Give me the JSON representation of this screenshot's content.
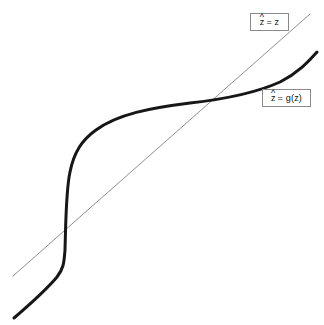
{
  "figure": {
    "background_color": "#ffffff",
    "width": 324,
    "height": 325
  },
  "labels": {
    "identity": {
      "var": "z",
      "hat": "^",
      "equation": "= z",
      "full_text": "ẑ = z"
    },
    "gfun": {
      "var": "z",
      "hat": "^",
      "equation": "= g(z)",
      "full_text": "ẑ = g(z)"
    }
  },
  "chart_data": {
    "type": "line",
    "title": "",
    "xlabel": "",
    "ylabel": "",
    "grid": false,
    "legend_position": "inline-boxed-annotations",
    "xlim": [
      0,
      324
    ],
    "ylim": [
      325,
      0
    ],
    "series": [
      {
        "name": "ẑ = z",
        "role": "identity-line",
        "color": "#8f8f8f",
        "linewidth": 1,
        "x": [
          13,
          310
        ],
        "y": [
          276,
          14
        ],
        "path": "M 13 276 L 310 14"
      },
      {
        "name": "ẑ = g(z)",
        "role": "sigmoid-response-curve",
        "color": "#161616",
        "linewidth": 3,
        "x": [
          14,
          30,
          46,
          58,
          64,
          67,
          70,
          76,
          92,
          120,
          150,
          190,
          228,
          262,
          290,
          305,
          313,
          317
        ],
        "y": [
          318,
          303,
          287,
          276,
          262,
          230,
          190,
          163,
          134,
          115,
          108,
          104,
          97,
          88,
          76,
          64,
          56,
          52
        ],
        "path": "M 14 318 C 28 306, 46 290, 57 277 C 64 268, 64 262, 65 250 C 66 215, 66 190, 70 172 C 74 152, 82 140, 96 130 C 118 114, 150 108, 190 103 C 226 99, 258 92, 280 82 C 298 73, 308 62, 317 52"
      }
    ],
    "annotations": [
      {
        "text": "ẑ = z",
        "x": 250,
        "y": 13,
        "width": 39,
        "height": 18,
        "boxed": true,
        "border_color": "#8a8a8a",
        "attached_to": "identity-line"
      },
      {
        "text": "ẑ = g(z)",
        "x": 262,
        "y": 89,
        "width": 49,
        "height": 18,
        "boxed": true,
        "border_color": "#8a8a8a",
        "attached_to": "sigmoid-response-curve"
      }
    ],
    "intersection_point": {
      "x": 228,
      "y": 87
    }
  }
}
